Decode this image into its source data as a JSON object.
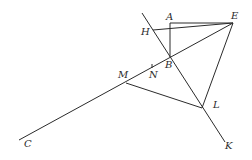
{
  "diagram": {
    "type": "geometry",
    "points": {
      "A": {
        "label": "A",
        "x": 170,
        "y": 23,
        "lx": 166,
        "ly": 20
      },
      "E": {
        "label": "E",
        "x": 233,
        "y": 23,
        "lx": 231,
        "ly": 19
      },
      "H": {
        "label": "H",
        "x": 153,
        "y": 30,
        "lx": 141,
        "ly": 35
      },
      "B": {
        "label": "B",
        "x": 170,
        "y": 57,
        "lx": 165,
        "ly": 68
      },
      "N": {
        "label": "N",
        "x": 152,
        "y": 66,
        "lx": 149,
        "ly": 78
      },
      "M": {
        "label": "M",
        "x": 126,
        "y": 83,
        "lx": 118,
        "ly": 78
      },
      "L": {
        "label": "L",
        "x": 202,
        "y": 108,
        "lx": 213,
        "ly": 108
      },
      "K": {
        "label": "K",
        "x": 225,
        "y": 142,
        "lx": 225,
        "ly": 149
      },
      "C": {
        "label": "C",
        "x": 19,
        "y": 140,
        "lx": 24,
        "ly": 147
      }
    },
    "segments": [
      {
        "name": "line-bk",
        "from": [
          142,
          13
        ],
        "to": [
          225,
          142
        ]
      },
      {
        "name": "segment-ae",
        "from": [
          170,
          23
        ],
        "to": [
          233,
          23
        ]
      },
      {
        "name": "segment-ab",
        "from": [
          170,
          23
        ],
        "to": [
          170,
          57
        ]
      },
      {
        "name": "segment-he",
        "from": [
          153,
          30
        ],
        "to": [
          233,
          23
        ]
      },
      {
        "name": "line-ce",
        "from": [
          19,
          140
        ],
        "to": [
          233,
          23
        ]
      },
      {
        "name": "segment-el",
        "from": [
          233,
          23
        ],
        "to": [
          202,
          108
        ]
      },
      {
        "name": "segment-ml",
        "from": [
          126,
          83
        ],
        "to": [
          202,
          108
        ]
      },
      {
        "name": "tick-n",
        "from": [
          152,
          64
        ],
        "to": [
          152,
          68
        ]
      }
    ]
  }
}
